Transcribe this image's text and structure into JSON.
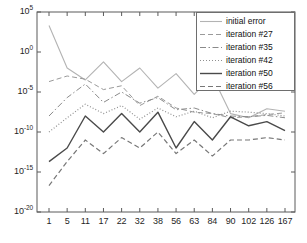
{
  "chart_data": {
    "type": "line",
    "title": "",
    "xlabel": "",
    "ylabel": "",
    "xscale": "categorical",
    "yscale": "log",
    "ylim": [
      1e-20,
      100000.0
    ],
    "ytick_values": [
      100000.0,
      1.0,
      1e-05,
      1e-10,
      1e-15,
      1e-20
    ],
    "ytick_labels": [
      "10^5",
      "10^0",
      "10^-5",
      "10^-10",
      "10^-15",
      "10^-20"
    ],
    "ytick_mantissa": [
      "10",
      "10",
      "10",
      "10",
      "10",
      "10"
    ],
    "ytick_exponents": [
      "5",
      "0",
      "-5",
      "-10",
      "-15",
      "-20"
    ],
    "categories": [
      "1",
      "5",
      "11",
      "17",
      "22",
      "32",
      "38",
      "56",
      "63",
      "84",
      "90",
      "102",
      "126",
      "167"
    ],
    "grid": false,
    "legend_position": "top-right",
    "series": [
      {
        "name": "initial error",
        "style": "solid",
        "color": "#b3b3b3",
        "width": 1.1,
        "values": [
          2000.0,
          0.01,
          0.00032,
          0.06,
          0.0002,
          0.01,
          3e-05,
          0.002,
          5e-06,
          0.001,
          2e-08,
          6e-09,
          8e-08,
          4e-08
        ]
      },
      {
        "name": "iteration #27",
        "style": "dashed",
        "color": "#9a9a9a",
        "width": 1.0,
        "values": [
          0.0002,
          0.001,
          0.0004,
          2e-05,
          6e-05,
          2e-07,
          3e-06,
          1e-07,
          3e-08,
          2e-08,
          6e-09,
          8e-09,
          1.5e-08,
          2.5e-08
        ]
      },
      {
        "name": "iteration #35",
        "style": "dashdot",
        "color": "#8a8a8a",
        "width": 1.0,
        "values": [
          1e-08,
          2e-06,
          0.0001,
          5e-07,
          1e-05,
          4e-07,
          2e-06,
          6e-08,
          1e-07,
          2e-08,
          1e-08,
          8e-09,
          1.2e-08,
          6e-09
        ]
      },
      {
        "name": "iteration #42",
        "style": "dotted",
        "color": "#8f8f8f",
        "width": 1.2,
        "values": [
          1e-10,
          6e-09,
          3e-07,
          2e-08,
          2e-07,
          4e-09,
          1e-07,
          8e-09,
          4e-08,
          6e-09,
          4e-08,
          3e-08,
          2e-08,
          1e-08
        ]
      },
      {
        "name": "iteration #50",
        "style": "solid",
        "color": "#4a4a4a",
        "width": 1.4,
        "values": [
          2e-14,
          1e-12,
          1e-08,
          1e-10,
          2e-08,
          1e-10,
          3e-08,
          1e-12,
          2e-09,
          1e-11,
          8e-09,
          6e-10,
          2e-09,
          1.5e-10
        ]
      },
      {
        "name": "iteration #56",
        "style": "dashed",
        "color": "#777777",
        "width": 1.2,
        "values": [
          2e-17,
          2e-14,
          1e-11,
          2e-13,
          2e-11,
          1e-12,
          1e-10,
          2e-13,
          1e-11,
          1e-13,
          1e-11,
          1e-11,
          2e-11,
          1e-11
        ]
      }
    ]
  },
  "legend": {
    "items": [
      {
        "label": "initial error"
      },
      {
        "label": "iteration #27"
      },
      {
        "label": "iteration #35"
      },
      {
        "label": "iteration #42"
      },
      {
        "label": "iteration #50"
      },
      {
        "label": "iteration #56"
      }
    ]
  }
}
